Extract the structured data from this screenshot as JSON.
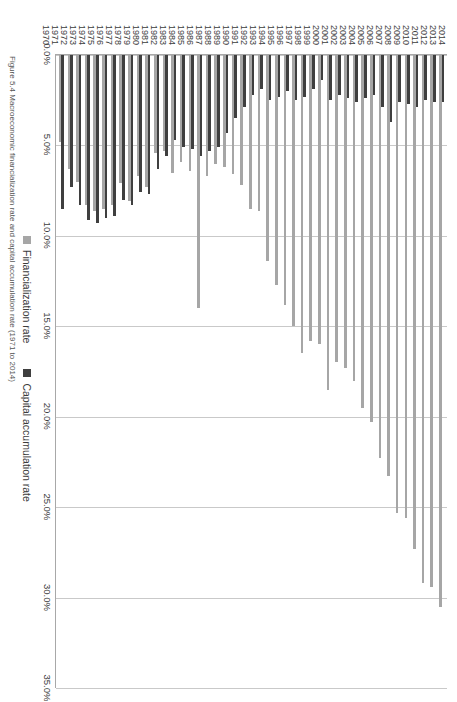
{
  "figure": {
    "caption": "Figure 5.4 Macroeconomic financialization rate and capital accumulation rate (1971 to 2014)"
  },
  "legend": {
    "items": [
      {
        "label": "Financialization rate",
        "color": "#a6a6a6",
        "swatch_name": "legend-swatch-financialization"
      },
      {
        "label": "Capital accumulation rate",
        "color": "#3f3f3f",
        "swatch_name": "legend-swatch-capital-accumulation"
      }
    ]
  },
  "chart_data": {
    "type": "bar",
    "orientation": "horizontal",
    "title": "",
    "xlabel": "",
    "ylabel": "",
    "xlim": [
      0,
      35
    ],
    "xticks": [
      "0.0%",
      "5.0%",
      "10.0%",
      "15.0%",
      "20.0%",
      "25.0%",
      "30.0%",
      "35.0%"
    ],
    "xtick_values": [
      0,
      5,
      10,
      15,
      20,
      25,
      30,
      35
    ],
    "grid": true,
    "legend_position": "bottom-left",
    "categories": [
      "2014",
      "2013",
      "2012",
      "2011",
      "2010",
      "2009",
      "2008",
      "2007",
      "2006",
      "2005",
      "2004",
      "2003",
      "2002",
      "2001",
      "2000",
      "1999",
      "1998",
      "1997",
      "1996",
      "1995",
      "1994",
      "1993",
      "1992",
      "1991",
      "1990",
      "1989",
      "1988",
      "1987",
      "1986",
      "1985",
      "1984",
      "1983",
      "1982",
      "1981",
      "1980",
      "1979",
      "1978",
      "1977",
      "1976",
      "1975",
      "1974",
      "1973",
      "1972",
      "1971",
      "1970"
    ],
    "series": [
      {
        "name": "Capital accumulation rate",
        "color": "#3f3f3f",
        "values": [
          2.6,
          2.6,
          2.5,
          2.9,
          2.7,
          2.6,
          3.7,
          2.9,
          2.2,
          2.4,
          2.6,
          2.4,
          2.2,
          2.5,
          1.4,
          1.9,
          2.3,
          2.5,
          2.0,
          2.3,
          2.5,
          1.9,
          2.2,
          2.9,
          3.5,
          4.3,
          5.1,
          5.3,
          5.6,
          5.2,
          5.1,
          4.7,
          5.6,
          6.3,
          7.7,
          7.6,
          8.3,
          8.0,
          8.9,
          9.0,
          9.3,
          9.1,
          8.3,
          7.3,
          8.5
        ]
      },
      {
        "name": "Financialization rate",
        "color": "#a6a6a6",
        "values": [
          30.5,
          29.4,
          29.2,
          27.3,
          25.6,
          25.3,
          23.3,
          22.3,
          20.3,
          19.5,
          18.0,
          17.3,
          17.0,
          18.5,
          16.0,
          15.8,
          16.5,
          15.0,
          13.8,
          12.7,
          11.4,
          8.6,
          8.5,
          7.2,
          6.6,
          6.2,
          6.0,
          6.7,
          14.0,
          6.4,
          5.9,
          6.5,
          5.3,
          5.4,
          7.3,
          6.7,
          8.1,
          7.1,
          8.3,
          8.5,
          8.6,
          8.3,
          7.0,
          6.3,
          4.8
        ]
      }
    ]
  }
}
